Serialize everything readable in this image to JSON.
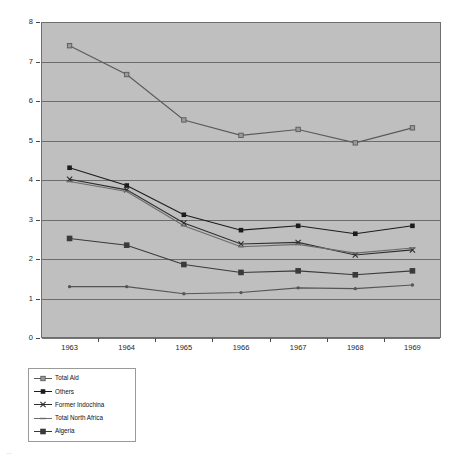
{
  "chart_data": {
    "type": "line",
    "title": "",
    "xlabel": "",
    "ylabel": "",
    "categories": [
      "1963",
      "1964",
      "1965",
      "1966",
      "1967",
      "1968",
      "1969"
    ],
    "x": [
      1963,
      1964,
      1965,
      1966,
      1967,
      1968,
      1969
    ],
    "xlim": [
      1963,
      1969
    ],
    "ylim": [
      0,
      8
    ],
    "yticks": [
      "0",
      "1",
      "2",
      "3",
      "4",
      "5",
      "6",
      "7",
      "8"
    ],
    "grid": "horizontal",
    "legend_position": "below-left",
    "plot_background": "#bfbfbf",
    "series": [
      {
        "name": "Total Aid",
        "marker": "square-open",
        "color": "#5a5a5a",
        "values": [
          7.4,
          6.67,
          5.52,
          5.13,
          5.28,
          4.94,
          5.32
        ]
      },
      {
        "name": "Others",
        "marker": "square-filled",
        "color": "#1c1c1c",
        "values": [
          4.31,
          3.86,
          3.12,
          2.73,
          2.84,
          2.64,
          2.84
        ]
      },
      {
        "name": "Former Indochina",
        "marker": "cross",
        "color": "#2e2e2e",
        "values": [
          4.02,
          3.75,
          2.91,
          2.38,
          2.42,
          2.1,
          2.23
        ]
      },
      {
        "name": "Total North Africa",
        "marker": "dash",
        "color": "#6b6b6b",
        "values": [
          3.96,
          3.71,
          2.84,
          2.31,
          2.37,
          2.15,
          2.28
        ]
      },
      {
        "name": "Algeria",
        "marker": "square-filled-small",
        "color": "#3a3a3a",
        "values": [
          2.52,
          2.35,
          1.86,
          1.66,
          1.7,
          1.6,
          1.7
        ]
      },
      {
        "name": "Algeria-lower",
        "marker": "dot",
        "color": "#555555",
        "values": [
          1.3,
          1.3,
          1.12,
          1.15,
          1.27,
          1.25,
          1.34
        ],
        "hidden_from_legend": true
      }
    ]
  },
  "legend": {
    "items": [
      {
        "label": "Total Aid"
      },
      {
        "label": "Others"
      },
      {
        "label": "Former Indochina"
      },
      {
        "label": "Total North Africa"
      },
      {
        "label": "Algeria"
      }
    ]
  },
  "caption": {
    "text": "…"
  }
}
